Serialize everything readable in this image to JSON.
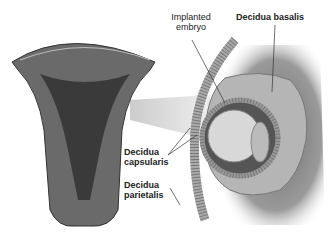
{
  "labels": {
    "implanted_embryo": [
      "Implanted",
      "embryo"
    ],
    "decidua_basalis": "Decidua basalis",
    "decidua_capsularis": [
      "Decidua",
      "capsularis"
    ],
    "decidua_parietalis": [
      "Decidua",
      "parietalis"
    ]
  },
  "colors": {
    "tissue_dark": "#4a4a4a",
    "tissue_mid": "#8a8a8a",
    "tissue_light": "#c8c8c8",
    "background_field": "#9a9a9a"
  }
}
